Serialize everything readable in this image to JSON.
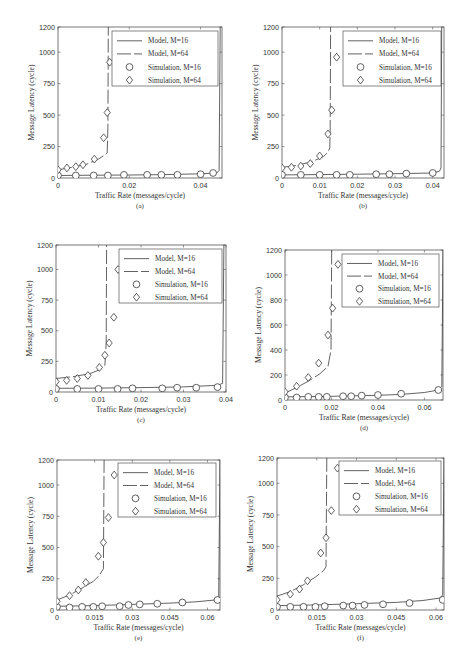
{
  "figure": {
    "xlabel": "Traffic Rate (messages/cycle)",
    "ylabel": "Message Latency (cycle)",
    "legend": [
      "Model, M=16",
      "Model, M=64",
      "Simulation, M=16",
      "Simulation, M=64"
    ]
  },
  "chart_data": [
    {
      "id": "a",
      "caption": "(a)",
      "type": "line",
      "xlabel": "Traffic Rate (messages/cycle)",
      "ylabel": "Message Latency (cycle)",
      "xlim": [
        0,
        0.046
      ],
      "ylim": [
        0,
        1200
      ],
      "xticks": [
        0,
        0.02,
        0.04
      ],
      "xtick_labels": [
        "0",
        "0.02",
        "0.04"
      ],
      "yticks": [
        0,
        250,
        500,
        750,
        1000,
        1200
      ],
      "ytick_labels": [
        "0",
        "250",
        "500",
        "750",
        "1000",
        "1200"
      ],
      "legend": [
        "Model, M=16",
        "Model, M=64",
        "Simulation, M=16",
        "Simulation, M=64"
      ],
      "series": [
        {
          "name": "Model, M=16",
          "style": "solid",
          "x": [
            0,
            0.01,
            0.02,
            0.03,
            0.04,
            0.0445,
            0.0452,
            0.0455
          ],
          "y": [
            20,
            22,
            24,
            27,
            33,
            40,
            60,
            1200
          ]
        },
        {
          "name": "Model, M=64",
          "style": "dashed",
          "x": [
            0,
            0.004,
            0.008,
            0.011,
            0.013,
            0.0138,
            0.014,
            0.0141
          ],
          "y": [
            65,
            85,
            110,
            145,
            180,
            200,
            400,
            1200
          ]
        },
        {
          "name": "Simulation, M=16",
          "marker": "circle",
          "x": [
            0,
            0.005,
            0.01,
            0.014,
            0.0185,
            0.025,
            0.029,
            0.0335,
            0.04,
            0.0435
          ],
          "y": [
            20,
            20,
            20,
            20,
            25,
            25,
            25,
            25,
            30,
            40
          ]
        },
        {
          "name": "Simulation, M=64",
          "marker": "diamond",
          "x": [
            0,
            0.0025,
            0.005,
            0.007,
            0.0102,
            0.0128,
            0.0138,
            0.0145
          ],
          "y": [
            65,
            80,
            90,
            105,
            150,
            320,
            520,
            920
          ]
        }
      ]
    },
    {
      "id": "b",
      "caption": "(b)",
      "type": "line",
      "xlabel": "Traffic Rate (messages/cycle)",
      "ylabel": "Message Latency (cycle)",
      "xlim": [
        0,
        0.043
      ],
      "ylim": [
        0,
        1200
      ],
      "xticks": [
        0,
        0.01,
        0.02,
        0.03,
        0.04
      ],
      "xtick_labels": [
        "0",
        "0.01",
        "0.02",
        "0.03",
        "0.04"
      ],
      "yticks": [
        0,
        250,
        500,
        750,
        1000,
        1200
      ],
      "ytick_labels": [
        "0",
        "250",
        "500",
        "750",
        "1000",
        "1200"
      ],
      "legend": [
        "Model, M=16",
        "Model, M=64",
        "Simulation, M=16",
        "Simulation, M=64"
      ],
      "series": [
        {
          "name": "Model, M=16",
          "style": "solid",
          "x": [
            0,
            0.01,
            0.02,
            0.03,
            0.04,
            0.0418,
            0.0422,
            0.0424
          ],
          "y": [
            25,
            27,
            30,
            34,
            40,
            55,
            80,
            1200
          ]
        },
        {
          "name": "Model, M=64",
          "style": "dashed",
          "x": [
            0,
            0.004,
            0.008,
            0.011,
            0.0122,
            0.0127,
            0.0128,
            0.0129
          ],
          "y": [
            85,
            100,
            130,
            170,
            205,
            240,
            400,
            1200
          ]
        },
        {
          "name": "Simulation, M=16",
          "marker": "circle",
          "x": [
            0,
            0.005,
            0.01,
            0.0145,
            0.018,
            0.025,
            0.0285,
            0.033,
            0.04
          ],
          "y": [
            25,
            25,
            25,
            25,
            25,
            30,
            30,
            35,
            40
          ]
        },
        {
          "name": "Simulation, M=64",
          "marker": "diamond",
          "x": [
            0,
            0.0025,
            0.005,
            0.0075,
            0.01,
            0.0122,
            0.0132,
            0.0145
          ],
          "y": [
            80,
            85,
            95,
            115,
            175,
            350,
            540,
            960
          ]
        }
      ]
    },
    {
      "id": "c",
      "caption": "(c)",
      "type": "line",
      "xlabel": "Traffic Rate (messages/cycle)",
      "ylabel": "Message Latency (cycle)",
      "xlim": [
        0,
        0.04
      ],
      "ylim": [
        0,
        1200
      ],
      "xticks": [
        0,
        0.01,
        0.02,
        0.03,
        0.04
      ],
      "xtick_labels": [
        "0",
        "0.01",
        "0.02",
        "0.03",
        "0.04"
      ],
      "yticks": [
        0,
        250,
        500,
        750,
        1000,
        1200
      ],
      "ytick_labels": [
        "0",
        "250",
        "500",
        "750",
        "1000",
        "1200"
      ],
      "legend": [
        "Model, M=16",
        "Model, M=64",
        "Simulation, M=16",
        "Simulation, M=64"
      ],
      "series": [
        {
          "name": "Model, M=16",
          "style": "solid",
          "x": [
            0,
            0.01,
            0.02,
            0.03,
            0.038,
            0.0392,
            0.0395
          ],
          "y": [
            30,
            32,
            36,
            42,
            55,
            70,
            1200
          ]
        },
        {
          "name": "Model, M=64",
          "style": "dashed",
          "x": [
            0,
            0.004,
            0.008,
            0.0105,
            0.0115,
            0.0118,
            0.0119
          ],
          "y": [
            110,
            125,
            150,
            185,
            220,
            400,
            1200
          ]
        },
        {
          "name": "Simulation, M=16",
          "marker": "circle",
          "x": [
            0,
            0.005,
            0.01,
            0.0145,
            0.018,
            0.025,
            0.0285,
            0.033,
            0.038
          ],
          "y": [
            25,
            25,
            25,
            25,
            30,
            30,
            35,
            35,
            40
          ]
        },
        {
          "name": "Simulation, M=64",
          "marker": "diamond",
          "x": [
            0,
            0.0025,
            0.005,
            0.0075,
            0.0102,
            0.0115,
            0.0125,
            0.0136,
            0.0146
          ],
          "y": [
            85,
            95,
            110,
            135,
            200,
            300,
            400,
            610,
            1000
          ]
        }
      ]
    },
    {
      "id": "d",
      "caption": "(d)",
      "type": "line",
      "xlabel": "Traffic Rate (messages/cycle)",
      "ylabel": "Message Latency (cycle)",
      "xlim": [
        0,
        0.068
      ],
      "ylim": [
        0,
        1200
      ],
      "xticks": [
        0,
        0.02,
        0.04,
        0.06
      ],
      "xtick_labels": [
        "0",
        "0.02",
        "0.04",
        "0.06"
      ],
      "yticks": [
        0,
        200,
        400,
        600,
        800,
        1000,
        1200
      ],
      "ytick_labels": [
        "0",
        "200",
        "400",
        "600",
        "800",
        "1000",
        "1200"
      ],
      "legend": [
        "Model, M=16",
        "Model, M=64",
        "Simulation, M=16",
        "Simulation, M=64"
      ],
      "series": [
        {
          "name": "Model, M=16",
          "style": "solid",
          "x": [
            0,
            0.02,
            0.04,
            0.05,
            0.06,
            0.066,
            0.0675,
            0.068
          ],
          "y": [
            25,
            30,
            38,
            45,
            60,
            80,
            110,
            1200
          ]
        },
        {
          "name": "Model, M=64",
          "style": "dashed",
          "x": [
            0,
            0.005,
            0.01,
            0.015,
            0.0185,
            0.0198,
            0.0201
          ],
          "y": [
            55,
            100,
            150,
            210,
            270,
            400,
            1200
          ]
        },
        {
          "name": "Simulation, M=16",
          "marker": "circle",
          "x": [
            0,
            0.005,
            0.01,
            0.0145,
            0.018,
            0.025,
            0.0285,
            0.033,
            0.04,
            0.05,
            0.066
          ],
          "y": [
            20,
            20,
            25,
            25,
            25,
            30,
            30,
            35,
            40,
            50,
            80
          ]
        },
        {
          "name": "Simulation, M=64",
          "marker": "diamond",
          "x": [
            0,
            0.005,
            0.01,
            0.0145,
            0.0185,
            0.0205,
            0.0228
          ],
          "y": [
            65,
            110,
            180,
            295,
            520,
            735,
            1085
          ]
        }
      ]
    },
    {
      "id": "e",
      "caption": "(e)",
      "type": "line",
      "xlabel": "Traffic Rate (messages/cycle)",
      "ylabel": "Message Latency (cycle)",
      "xlim": [
        0,
        0.065
      ],
      "ylim": [
        0,
        1200
      ],
      "xticks": [
        0,
        0.015,
        0.03,
        0.045,
        0.06
      ],
      "xtick_labels": [
        "0",
        "0.015",
        "0.03",
        "0.045",
        "0.06"
      ],
      "yticks": [
        0,
        250,
        500,
        750,
        1000,
        1200
      ],
      "ytick_labels": [
        "0",
        "250",
        "500",
        "750",
        "1000",
        "1200"
      ],
      "legend": [
        "Model, M=16",
        "Model, M=64",
        "Simulation, M=16",
        "Simulation, M=64"
      ],
      "series": [
        {
          "name": "Model, M=16",
          "style": "solid",
          "x": [
            0,
            0.015,
            0.03,
            0.045,
            0.055,
            0.063,
            0.0645,
            0.065
          ],
          "y": [
            30,
            35,
            45,
            55,
            65,
            80,
            100,
            1200
          ]
        },
        {
          "name": "Model, M=64",
          "style": "dashed",
          "x": [
            0,
            0.005,
            0.01,
            0.0145,
            0.017,
            0.0185,
            0.0188
          ],
          "y": [
            80,
            120,
            175,
            230,
            280,
            330,
            1200
          ]
        },
        {
          "name": "Simulation, M=16",
          "marker": "circle",
          "x": [
            0,
            0.005,
            0.01,
            0.0145,
            0.018,
            0.025,
            0.0285,
            0.033,
            0.04,
            0.05,
            0.064
          ],
          "y": [
            25,
            20,
            25,
            25,
            30,
            30,
            40,
            45,
            50,
            60,
            80
          ]
        },
        {
          "name": "Simulation, M=64",
          "marker": "diamond",
          "x": [
            0,
            0.005,
            0.0085,
            0.0115,
            0.0165,
            0.0185,
            0.0205,
            0.0228
          ],
          "y": [
            70,
            115,
            160,
            220,
            430,
            540,
            740,
            1080
          ]
        }
      ]
    },
    {
      "id": "f",
      "caption": "(f)",
      "type": "line",
      "xlabel": "Traffic Rate (messages/cycle)",
      "ylabel": "Message Latency (cycle)",
      "xlim": [
        0,
        0.063
      ],
      "ylim": [
        0,
        1200
      ],
      "xticks": [
        0,
        0.015,
        0.03,
        0.045,
        0.06
      ],
      "xtick_labels": [
        "0",
        "0.015",
        "0.03",
        "0.045",
        "0.06"
      ],
      "yticks": [
        0,
        250,
        500,
        750,
        1000,
        1200
      ],
      "ytick_labels": [
        "0",
        "250",
        "500",
        "750",
        "1000",
        "1200"
      ],
      "legend": [
        "Model, M=16",
        "Model, M=64",
        "Simulation, M=16",
        "Simulation, M=64"
      ],
      "series": [
        {
          "name": "Model, M=16",
          "style": "solid",
          "x": [
            0,
            0.015,
            0.03,
            0.045,
            0.055,
            0.0615,
            0.0625,
            0.063
          ],
          "y": [
            35,
            40,
            50,
            60,
            75,
            95,
            120,
            1200
          ]
        },
        {
          "name": "Model, M=64",
          "style": "dashed",
          "x": [
            0,
            0.005,
            0.01,
            0.0145,
            0.0175,
            0.0185,
            0.0188
          ],
          "y": [
            110,
            145,
            200,
            260,
            310,
            340,
            1200
          ]
        },
        {
          "name": "Simulation, M=16",
          "marker": "circle",
          "x": [
            0,
            0.005,
            0.01,
            0.0145,
            0.018,
            0.025,
            0.0285,
            0.033,
            0.04,
            0.05,
            0.0625
          ],
          "y": [
            25,
            25,
            25,
            25,
            30,
            35,
            35,
            40,
            45,
            55,
            80
          ]
        },
        {
          "name": "Simulation, M=64",
          "marker": "diamond",
          "x": [
            0,
            0.005,
            0.0085,
            0.0115,
            0.0165,
            0.0185,
            0.0205,
            0.0228
          ],
          "y": [
            80,
            125,
            165,
            230,
            450,
            570,
            785,
            1120
          ]
        }
      ]
    }
  ]
}
